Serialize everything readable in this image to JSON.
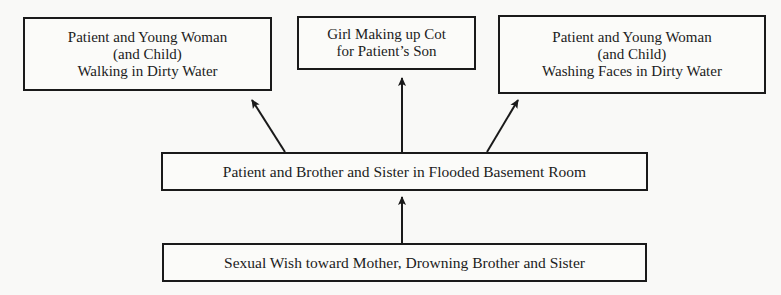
{
  "diagram": {
    "type": "flow-diagram",
    "direction": "bottom-to-top",
    "nodes": [
      {
        "id": "top_left",
        "lines": [
          "Patient and Young Woman",
          "(and Child)",
          "Walking in Dirty Water"
        ]
      },
      {
        "id": "top_middle",
        "lines": [
          "Girl Making up Cot",
          "for Patient’s Son"
        ]
      },
      {
        "id": "top_right",
        "lines": [
          "Patient and Young Woman",
          "(and Child)",
          "Washing Faces in Dirty Water"
        ]
      },
      {
        "id": "middle",
        "lines": [
          "Patient and Brother and Sister in Flooded Basement Room"
        ]
      },
      {
        "id": "bottom",
        "lines": [
          "Sexual Wish toward Mother, Drowning Brother and Sister"
        ]
      }
    ],
    "edges": [
      {
        "from": "bottom",
        "to": "middle"
      },
      {
        "from": "middle",
        "to": "top_left"
      },
      {
        "from": "middle",
        "to": "top_middle"
      },
      {
        "from": "middle",
        "to": "top_right"
      }
    ],
    "colors": {
      "line": "#1a1a1a",
      "background": "#f9f9f7",
      "text": "#1c1c1c"
    }
  }
}
